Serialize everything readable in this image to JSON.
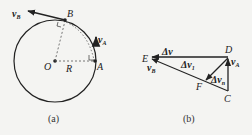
{
  "figure_a": {
    "caption": "(a)",
    "labels": {
      "vB": "v",
      "vB_sub": "B",
      "B": "B",
      "vA": "v",
      "vA_sub": "A",
      "O": "O",
      "R": "R",
      "A": "A"
    }
  },
  "figure_b": {
    "caption": "(b)",
    "labels": {
      "E": "E",
      "D": "D",
      "C": "C",
      "F": "F",
      "dv": "Δv",
      "dv1": "Δv",
      "dv1_sub": "1",
      "dvn": "Δv",
      "dvn_sub": "n",
      "vA": "v",
      "vA_sub": "A",
      "vB": "v",
      "vB_sub": "B"
    }
  },
  "colors": {
    "stroke": "#222222",
    "dashed": "#555555",
    "background": "#f4f4f2"
  }
}
